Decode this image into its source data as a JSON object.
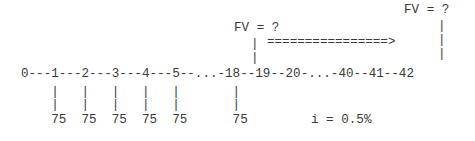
{
  "diagram": {
    "kind": "cash-flow-timeline",
    "colors": {
      "background": "#ffffff",
      "text": "#3a3a3a"
    },
    "timeline": {
      "axis_line": "0---1---2---3---4---5--...-18--19--20-...-40--41--42",
      "periods_shown": [
        "0",
        "1",
        "2",
        "3",
        "4",
        "5",
        "18",
        "19",
        "20",
        "40",
        "41",
        "42"
      ],
      "ellipses": [
        "...",
        "..."
      ]
    },
    "future_value": {
      "label_at_18": "FV = ?",
      "label_at_42": "FV = ?",
      "stem_upper_at_18": "                      |                                |",
      "stem_upper_row2": "                      |                                |"
    },
    "accumulation_arrow": {
      "glyph": "================>",
      "row": "                          ================>         |"
    },
    "payments": {
      "amount": "75",
      "count_shown": 6,
      "row": "    75  75  75  75  75      75",
      "stem_row_a": "    |   |   |   |   |       |",
      "stem_row_b": "    |   |   |   |   |       |"
    },
    "interest": {
      "text": "i = 0.5%",
      "rate_value": "0.5%",
      "symbol": "i"
    }
  }
}
